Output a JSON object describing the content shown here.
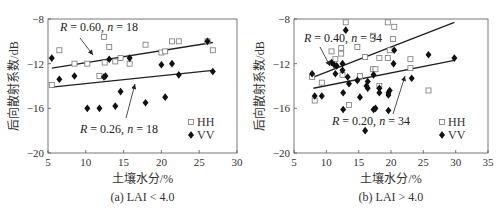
{
  "chart_data": [
    {
      "type": "scatter",
      "caption": "(a) LAI < 4.0",
      "xlabel": "土壤水分/%",
      "ylabel": "后向散射系数/dB",
      "xlim": [
        5,
        30
      ],
      "ylim": [
        -20,
        -8
      ],
      "xticks": [
        5,
        10,
        15,
        20,
        25,
        30
      ],
      "yticks": [
        -8,
        -12,
        -16,
        -20
      ],
      "grid": false,
      "legend": {
        "position": "lower right",
        "entries": [
          "HH",
          "VV"
        ]
      },
      "series": [
        {
          "name": "HH",
          "marker": "open-square",
          "points": [
            [
              5.5,
              -13.9
            ],
            [
              6.5,
              -10.8
            ],
            [
              8.5,
              -12.0
            ],
            [
              10.2,
              -12.0
            ],
            [
              11.8,
              -13.1
            ],
            [
              12.4,
              -9.6
            ],
            [
              12.5,
              -11.9
            ],
            [
              13.1,
              -10.5
            ],
            [
              13.9,
              -11.8
            ],
            [
              14.6,
              -11.5
            ],
            [
              15.8,
              -12.0
            ],
            [
              17.9,
              -10.3
            ],
            [
              20.0,
              -11.0
            ],
            [
              20.5,
              -10.9
            ],
            [
              21.4,
              -10.0
            ],
            [
              22.3,
              -10.0
            ],
            [
              26.8,
              -10.8
            ],
            [
              26.1,
              -10.0
            ]
          ]
        },
        {
          "name": "VV",
          "marker": "filled-diamond",
          "points": [
            [
              5.5,
              -11.5
            ],
            [
              6.5,
              -13.4
            ],
            [
              8.5,
              -13.1
            ],
            [
              10.2,
              -16.0
            ],
            [
              11.8,
              -16.0
            ],
            [
              12.4,
              -13.2
            ],
            [
              12.6,
              -13.1
            ],
            [
              13.1,
              -11.6
            ],
            [
              13.9,
              -15.8
            ],
            [
              14.6,
              -14.5
            ],
            [
              15.8,
              -11.5
            ],
            [
              17.9,
              -15.5
            ],
            [
              20.0,
              -12.1
            ],
            [
              20.5,
              -15.0
            ],
            [
              21.4,
              -12.0
            ],
            [
              22.3,
              -13.0
            ],
            [
              26.1,
              -10.0
            ],
            [
              26.8,
              -12.7
            ]
          ]
        }
      ],
      "fit_lines": [
        {
          "series": "HH",
          "x": [
            5.5,
            26.8
          ],
          "y": [
            -12.4,
            -10.1
          ],
          "label": "R = 0.60, n = 18"
        },
        {
          "series": "VV",
          "x": [
            5.5,
            26.8
          ],
          "y": [
            -14.1,
            -12.6
          ],
          "label": "R = 0.26, n = 18"
        }
      ]
    },
    {
      "type": "scatter",
      "caption": "(b) LAI > 4.0",
      "xlabel": "土壤水分/%",
      "ylabel": "后向散射系数/dB",
      "xlim": [
        5,
        35
      ],
      "ylim": [
        -20,
        -8
      ],
      "xticks": [
        5,
        10,
        15,
        20,
        25,
        30,
        35
      ],
      "yticks": [
        -8,
        -12,
        -16,
        -20
      ],
      "grid": false,
      "legend": {
        "position": "lower right",
        "entries": [
          "HH",
          "VV"
        ]
      },
      "series": [
        {
          "name": "HH",
          "marker": "open-square",
          "points": [
            [
              7.8,
              -13.2
            ],
            [
              8.2,
              -15.3
            ],
            [
              9.3,
              -13.7
            ],
            [
              10.8,
              -10.9
            ],
            [
              11.4,
              -11.6
            ],
            [
              12.3,
              -10.6
            ],
            [
              12.3,
              -11.1
            ],
            [
              12.5,
              -13.0
            ],
            [
              13.0,
              -8.3
            ],
            [
              13.5,
              -15.7
            ],
            [
              14.8,
              -10.5
            ],
            [
              15.2,
              -13.1
            ],
            [
              16.0,
              -11.4
            ],
            [
              17.2,
              -9.5
            ],
            [
              17.2,
              -12.5
            ],
            [
              17.6,
              -12.5
            ],
            [
              18.2,
              -11.5
            ],
            [
              18.2,
              -14.0
            ],
            [
              19.5,
              -8.3
            ],
            [
              19.5,
              -11.5
            ],
            [
              19.8,
              -10.8
            ],
            [
              20.3,
              -9.8
            ],
            [
              20.5,
              -8.7
            ],
            [
              23.0,
              -11.6
            ],
            [
              23.0,
              -12.4
            ],
            [
              25.8,
              -14.4
            ]
          ]
        },
        {
          "name": "VV",
          "marker": "filled-diamond",
          "points": [
            [
              7.8,
              -12.9
            ],
            [
              8.2,
              -14.9
            ],
            [
              9.3,
              -14.9
            ],
            [
              10.8,
              -11.9
            ],
            [
              11.2,
              -12.1
            ],
            [
              11.4,
              -12.9
            ],
            [
              11.6,
              -12.2
            ],
            [
              12.5,
              -12.0
            ],
            [
              12.5,
              -12.6
            ],
            [
              12.6,
              -14.6
            ],
            [
              12.6,
              -16.1
            ],
            [
              13.0,
              -9.0
            ],
            [
              13.3,
              -13.2
            ],
            [
              13.5,
              -13.8
            ],
            [
              14.8,
              -13.5
            ],
            [
              15.2,
              -15.0
            ],
            [
              16.0,
              -18.0
            ],
            [
              16.2,
              -14.0
            ],
            [
              16.4,
              -13.6
            ],
            [
              16.4,
              -14.2
            ],
            [
              17.3,
              -13.0
            ],
            [
              17.3,
              -16.1
            ],
            [
              17.6,
              -16.0
            ],
            [
              18.2,
              -14.2
            ],
            [
              18.2,
              -14.6
            ],
            [
              19.6,
              -14.6
            ],
            [
              19.6,
              -14.8
            ],
            [
              19.6,
              -16.2
            ],
            [
              19.8,
              -14.4
            ],
            [
              20.4,
              -12.0
            ],
            [
              20.5,
              -10.8
            ],
            [
              23.2,
              -13.3
            ],
            [
              25.8,
              -11.2
            ],
            [
              29.8,
              -11.5
            ]
          ]
        }
      ],
      "fit_lines": [
        {
          "series": "HH",
          "x": [
            8.0,
            29.8
          ],
          "y": [
            -13.2,
            -8.3
          ],
          "label": "R = 0.40, n = 34"
        },
        {
          "series": "VV",
          "x": [
            8.0,
            29.8
          ],
          "y": [
            -14.2,
            -11.7
          ],
          "label": "R = 0.20, n = 34"
        }
      ]
    }
  ]
}
